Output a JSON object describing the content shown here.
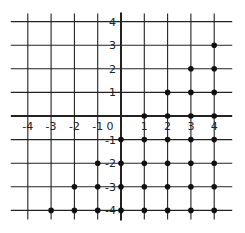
{
  "diagram": {
    "type": "coordinate-grid",
    "x_ticks": [
      -4,
      -3,
      -2,
      -1,
      1,
      2,
      3,
      4
    ],
    "y_ticks": [
      4,
      3,
      2,
      1,
      -1,
      -2,
      -3,
      -4
    ],
    "origin_label": "0",
    "x_labels": [
      "-4",
      "-3",
      "-2",
      "-1",
      "1",
      "2",
      "3",
      "4"
    ],
    "y_labels": [
      "4",
      "3",
      "2",
      "1",
      "-1",
      "-2",
      "-3",
      "-4"
    ],
    "points": [
      [
        1,
        0
      ],
      [
        2,
        0
      ],
      [
        3,
        0
      ],
      [
        4,
        0
      ],
      [
        2,
        1
      ],
      [
        3,
        1
      ],
      [
        4,
        1
      ],
      [
        3,
        2
      ],
      [
        4,
        2
      ],
      [
        4,
        3
      ],
      [
        0,
        -1
      ],
      [
        1,
        -1
      ],
      [
        2,
        -1
      ],
      [
        3,
        -1
      ],
      [
        4,
        -1
      ],
      [
        -1,
        -2
      ],
      [
        0,
        -2
      ],
      [
        1,
        -2
      ],
      [
        2,
        -2
      ],
      [
        3,
        -2
      ],
      [
        4,
        -2
      ],
      [
        -2,
        -3
      ],
      [
        -1,
        -3
      ],
      [
        0,
        -3
      ],
      [
        1,
        -3
      ],
      [
        2,
        -3
      ],
      [
        3,
        -3
      ],
      [
        4,
        -3
      ],
      [
        -3,
        -4
      ],
      [
        -2,
        -4
      ],
      [
        -1,
        -4
      ],
      [
        0,
        -4
      ],
      [
        1,
        -4
      ],
      [
        2,
        -4
      ],
      [
        3,
        -4
      ],
      [
        4,
        -4
      ]
    ],
    "colors": {
      "line": "#222222",
      "point": "#111111",
      "background": "#ffffff"
    }
  }
}
